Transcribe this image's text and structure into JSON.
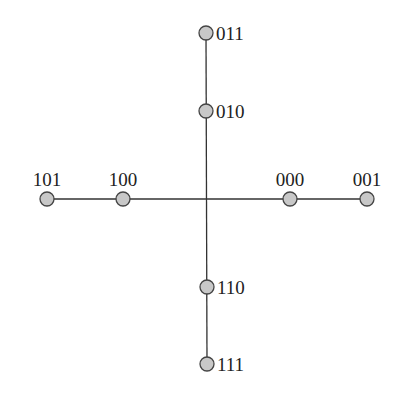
{
  "diagram": {
    "type": "binary-label-cross-graph",
    "center": {
      "x": 206,
      "y": 199
    },
    "colors": {
      "node_fill": "#c8c8c8",
      "node_stroke": "#444444",
      "edge": "#333333",
      "text": "#222222"
    },
    "nodes": [
      {
        "id": "011",
        "label": "011",
        "x": 206,
        "y": 33,
        "label_pos": "right"
      },
      {
        "id": "010",
        "label": "010",
        "x": 206,
        "y": 111,
        "label_pos": "right"
      },
      {
        "id": "101",
        "label": "101",
        "x": 47,
        "y": 199,
        "label_pos": "above"
      },
      {
        "id": "100",
        "label": "100",
        "x": 123,
        "y": 199,
        "label_pos": "above"
      },
      {
        "id": "000",
        "label": "000",
        "x": 290,
        "y": 199,
        "label_pos": "above"
      },
      {
        "id": "001",
        "label": "001",
        "x": 367,
        "y": 199,
        "label_pos": "above"
      },
      {
        "id": "110",
        "label": "110",
        "x": 207,
        "y": 287,
        "label_pos": "right"
      },
      {
        "id": "111",
        "label": "111",
        "x": 207,
        "y": 364,
        "label_pos": "right"
      }
    ],
    "edges": [
      {
        "from": "011",
        "to": "111"
      },
      {
        "from": "101",
        "to": "001"
      }
    ]
  }
}
